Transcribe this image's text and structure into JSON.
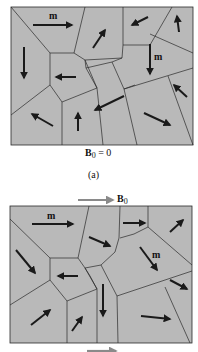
{
  "figure": {
    "panel_a": {
      "domain_label": "m",
      "domain_label_2": "m",
      "field_label_main": "B",
      "field_label_sub": "0",
      "field_label_eq": " = 0",
      "caption": "(a)"
    },
    "panel_b": {
      "field_arrow_label_main": "B",
      "field_arrow_label_sub": "0",
      "domain_label": "m",
      "domain_label_2": "m"
    },
    "colors": {
      "domain_fill": "#b9b9b9",
      "boundary": "#2a2a2a",
      "moment_arrow": "#1a1a1a",
      "field_arrow": "#8a8a8a"
    }
  }
}
